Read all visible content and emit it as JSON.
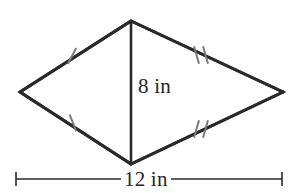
{
  "figure": {
    "name": "kite-with-altitude",
    "shape_type": "kite",
    "background_color": "#ffffff",
    "edge_color": "#2a2a2a",
    "edge_width": 3,
    "altitude_color": "#2a2a2a",
    "altitude_width": 2.6,
    "tick_color": "#7a7a7a",
    "tick_width": 2,
    "dimension_color": "#2a2a2a",
    "dimension_width": 1.6,
    "vertices": {
      "top": {
        "x": 131,
        "y": 21
      },
      "left": {
        "x": 20,
        "y": 92
      },
      "right": {
        "x": 283,
        "y": 92
      },
      "bottom": {
        "x": 131,
        "y": 164
      }
    },
    "altitude": {
      "from": {
        "x": 131,
        "y": 21
      },
      "to": {
        "x": 131,
        "y": 164
      }
    },
    "edges": [
      {
        "name": "top-left-edge",
        "from": "top",
        "to": "left",
        "tick_count": 1
      },
      {
        "name": "top-right-edge",
        "from": "top",
        "to": "right",
        "tick_count": 2
      },
      {
        "name": "bottom-left-edge",
        "from": "left",
        "to": "bottom",
        "tick_count": 1
      },
      {
        "name": "bottom-right-edge",
        "from": "bottom",
        "to": "right",
        "tick_count": 2
      }
    ],
    "tick_marks": [
      {
        "name": "tick-top-left",
        "cx": 72,
        "cy": 56,
        "count": 1,
        "angle": 28
      },
      {
        "name": "tick-top-right",
        "cx": 201,
        "cy": 55,
        "count": 2,
        "angle": -16
      },
      {
        "name": "tick-bottom-left",
        "cx": 73,
        "cy": 123,
        "count": 1,
        "angle": -22
      },
      {
        "name": "tick-bottom-right",
        "cx": 201,
        "cy": 129,
        "count": 2,
        "angle": 16
      }
    ],
    "dimension_line": {
      "name": "width-dimension",
      "y": 179,
      "x_start": 16,
      "x_end": 282,
      "cap_height": 14
    }
  },
  "labels": {
    "height": "8 in",
    "width": "12 in"
  },
  "chart_data": {
    "type": "diagram",
    "shape": "kite",
    "title": "",
    "measurements": [
      {
        "label": "8 in",
        "value": 8,
        "unit": "in",
        "describes": "vertical diagonal (height)"
      },
      {
        "label": "12 in",
        "value": 12,
        "unit": "in",
        "describes": "horizontal diagonal (width)"
      }
    ],
    "congruence_marks": {
      "single_tick_pair": [
        "top-left-edge",
        "bottom-left-edge"
      ],
      "double_tick_pair": [
        "top-right-edge",
        "bottom-right-edge"
      ]
    }
  }
}
